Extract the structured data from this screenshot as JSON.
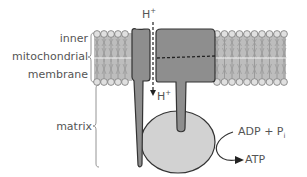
{
  "diagram": {
    "labels": {
      "membrane_line1": "inner",
      "membrane_line2": "mitochondrial",
      "membrane_line3": "membrane",
      "matrix": "matrix",
      "proton_top": "H",
      "proton_top_charge": "+",
      "proton_bottom": "H",
      "proton_bottom_charge": "+",
      "reactant": "ADP + P",
      "reactant_subscript": "i",
      "product": "ATP"
    },
    "colors": {
      "protein_fill": "#8e8e8e",
      "head_fill": "#d2d2d2",
      "outline": "#333333",
      "lipid_head": "#d9d9d9",
      "lipid_tail": "#9a9a9a",
      "text": "#555555",
      "brace": "#888888"
    }
  }
}
